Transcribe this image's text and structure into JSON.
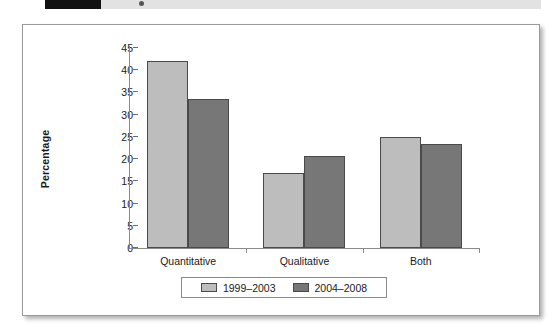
{
  "caption_strip": {
    "figure_number": "5",
    "note": "cropped-figure-caption-bar"
  },
  "chart_data": {
    "type": "bar",
    "title": "",
    "xlabel": "",
    "ylabel": "Percentage",
    "ylim": [
      0,
      45
    ],
    "ytick_step": 5,
    "yticks": [
      "45",
      "40",
      "35",
      "30",
      "25",
      "20",
      "15",
      "10",
      "5",
      "0"
    ],
    "grid": false,
    "legend_position": "bottom-center",
    "categories": [
      "Quantitative",
      "Qualitative",
      "Both"
    ],
    "series": [
      {
        "name": "1999–2003",
        "color": "#bdbdbd",
        "values": [
          42.0,
          16.8,
          25.0
        ]
      },
      {
        "name": "2004–2008",
        "color": "#777777",
        "values": [
          33.5,
          20.8,
          23.3
        ]
      }
    ]
  },
  "colors": {
    "series_light": "#bdbdbd",
    "series_dark": "#777777",
    "axis": "#8a8a8a",
    "frame": "#9a9a9a",
    "text": "#1a1a1a"
  }
}
